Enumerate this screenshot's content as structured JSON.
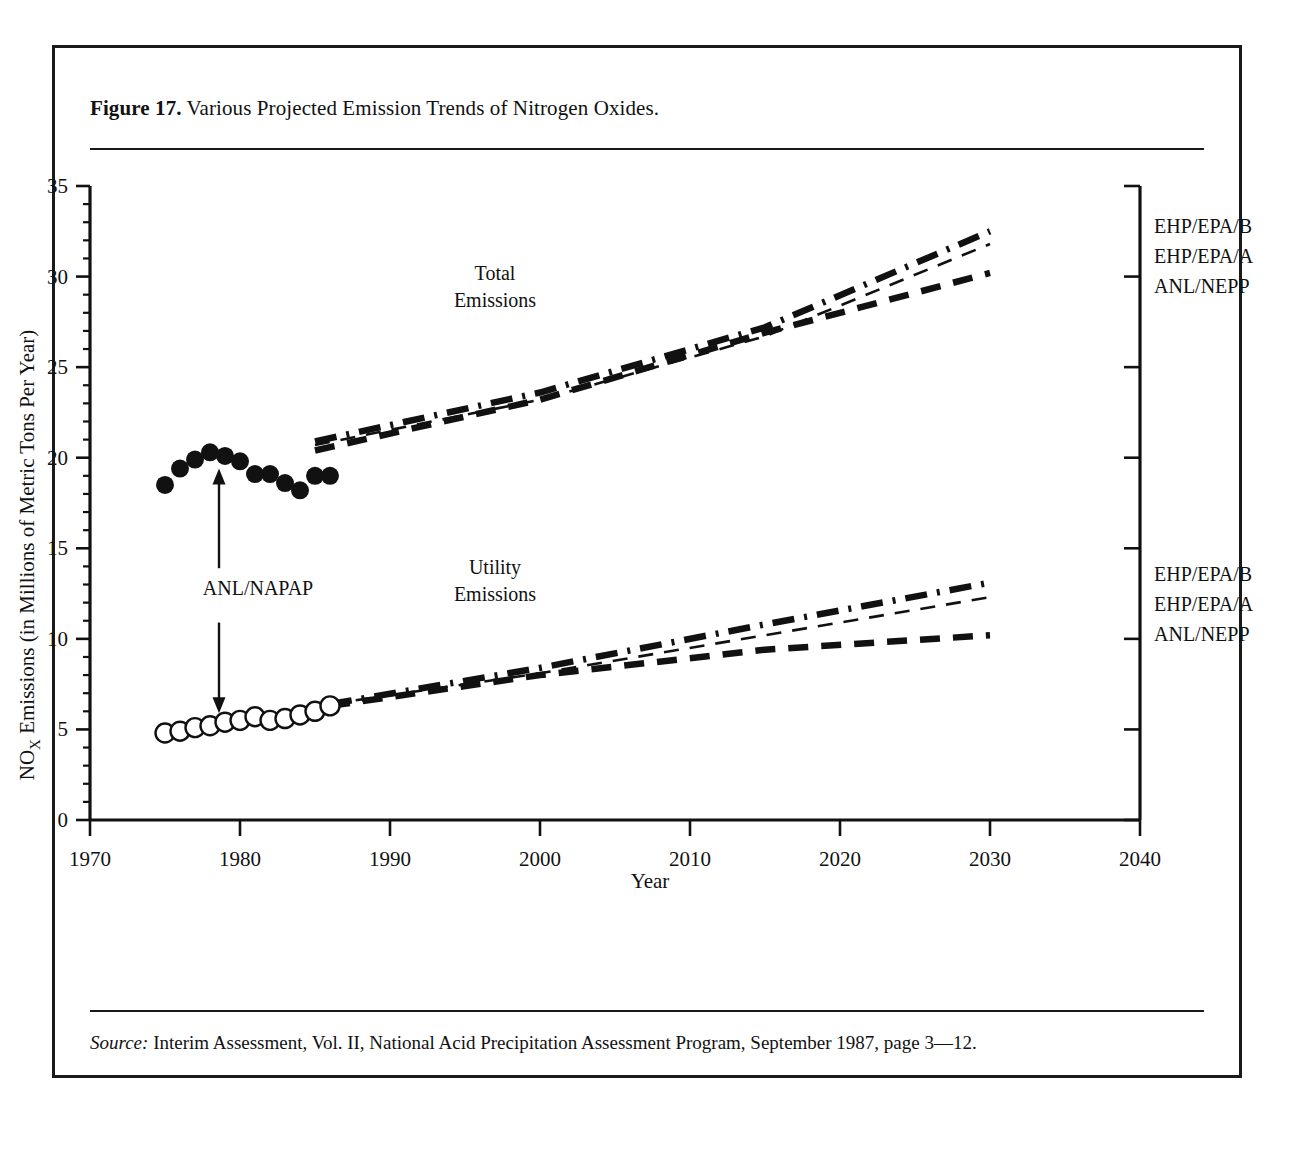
{
  "figure": {
    "label": "Figure 17.",
    "title": "Various Projected Emission Trends of Nitrogen Oxides.",
    "source_label": "Source:",
    "source_text": "Interim Assessment, Vol. II, National Acid Precipitation Assessment Program, September 1987, page 3—12."
  },
  "chart_data": {
    "type": "line",
    "title": "Various Projected Emission Trends of Nitrogen Oxides",
    "xlabel": "Year",
    "ylabel": "NOₓ Emissions (in Millions of Metric Tons Per Year)",
    "ylabel_parts": {
      "prefix": "NO",
      "subscript": "X",
      "rest": " Emissions (in Millions of Metric Tons Per Year)"
    },
    "xlim": [
      1970,
      2040
    ],
    "ylim": [
      0,
      35
    ],
    "xticks": [
      1970,
      1980,
      1990,
      2000,
      2010,
      2020,
      2030,
      2040
    ],
    "xtick_labels": [
      "1970",
      "1980",
      "1990",
      "2000",
      "2010",
      "2020",
      "2030",
      "2040"
    ],
    "yticks": [
      0,
      5,
      10,
      15,
      20,
      25,
      30,
      35
    ],
    "ytick_labels": [
      "0",
      "5",
      "10",
      "15",
      "20",
      "25",
      "30",
      "35"
    ],
    "yminor_step": 1,
    "grid": false,
    "legend_position": "right-inline",
    "annotations": [
      {
        "name": "total-emissions",
        "text_line1": "Total",
        "text_line2": "Emissions",
        "x": 1997,
        "y": 29.8
      },
      {
        "name": "utility-emissions",
        "text_line1": "Utility",
        "text_line2": "Emissions",
        "x": 1997,
        "y": 13.6
      },
      {
        "name": "anl-napap",
        "text": "ANL/NAPAP",
        "x": 1981.2,
        "y": 12.4
      }
    ],
    "series": [
      {
        "name": "ANL/NAPAP Total Emissions (historical)",
        "label": "ANL/NAPAP",
        "group": "total",
        "marker": "filled-circle",
        "style": "markers",
        "x": [
          1975,
          1976,
          1977,
          1978,
          1979,
          1980,
          1981,
          1982,
          1983,
          1984,
          1985,
          1986
        ],
        "values": [
          18.5,
          19.4,
          19.9,
          20.3,
          20.1,
          19.8,
          19.1,
          19.1,
          18.6,
          18.2,
          19.0,
          19.0
        ]
      },
      {
        "name": "ANL/NAPAP Utility Emissions (historical)",
        "label": "ANL/NAPAP",
        "group": "utility",
        "marker": "open-circle",
        "style": "markers",
        "x": [
          1975,
          1976,
          1977,
          1978,
          1979,
          1980,
          1981,
          1982,
          1983,
          1984,
          1985,
          1986
        ],
        "values": [
          4.8,
          4.9,
          5.1,
          5.2,
          5.4,
          5.5,
          5.7,
          5.5,
          5.6,
          5.8,
          6.0,
          6.3
        ]
      },
      {
        "name": "EHP/EPA/B Total",
        "label": "EHP/EPA/B",
        "group": "total",
        "style": "thick-dash-dot",
        "x": [
          1985,
          2000,
          2015,
          2030
        ],
        "values": [
          20.9,
          23.6,
          27.2,
          32.5
        ]
      },
      {
        "name": "EHP/EPA/A Total",
        "label": "EHP/EPA/A",
        "group": "total",
        "style": "thin-dash",
        "x": [
          1985,
          2000,
          2015,
          2030
        ],
        "values": [
          20.7,
          23.2,
          26.7,
          31.8
        ]
      },
      {
        "name": "ANL/NEPP Total",
        "label": "ANL/NEPP",
        "group": "total",
        "style": "thick-dash",
        "x": [
          1985,
          2000,
          2015,
          2030
        ],
        "values": [
          20.4,
          23.2,
          26.9,
          30.2
        ]
      },
      {
        "name": "EHP/EPA/B Utility",
        "label": "EHP/EPA/B",
        "group": "utility",
        "style": "thick-dash-dot",
        "x": [
          1986,
          2000,
          2015,
          2030
        ],
        "values": [
          6.4,
          8.4,
          10.8,
          13.1
        ]
      },
      {
        "name": "EHP/EPA/A Utility",
        "label": "EHP/EPA/A",
        "group": "utility",
        "style": "thin-dash",
        "x": [
          1986,
          2000,
          2015,
          2030
        ],
        "values": [
          6.4,
          8.1,
          10.2,
          12.3
        ]
      },
      {
        "name": "ANL/NEPP Utility",
        "label": "ANL/NEPP",
        "group": "utility",
        "style": "thick-dash",
        "x": [
          1986,
          2000,
          2015,
          2030
        ],
        "values": [
          6.3,
          8.0,
          9.4,
          10.2
        ]
      }
    ],
    "legend_total": [
      "EHP/EPA/B",
      "EHP/EPA/A",
      "ANL/NEPP"
    ],
    "legend_utility": [
      "EHP/EPA/B",
      "EHP/EPA/A",
      "ANL/NEPP"
    ]
  }
}
